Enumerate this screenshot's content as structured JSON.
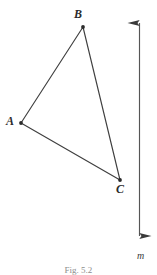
{
  "figure": {
    "background_color": "#ffffff",
    "ink_color": "#3a3a3a",
    "width": 157,
    "height": 275,
    "caption": "Fig. 5.2"
  },
  "labels": {
    "vertex_a": "A",
    "vertex_b": "B",
    "vertex_c": "C",
    "line_m": "m"
  },
  "chart_data": {
    "type": "scatter",
    "title": "",
    "xlabel": "",
    "ylabel": "",
    "xlim": [
      0,
      157
    ],
    "ylim": [
      275,
      0
    ],
    "grid": false,
    "legend": "none",
    "points": [
      {
        "name": "A",
        "x": 21,
        "y": 123,
        "label": "A",
        "label_position": "left"
      },
      {
        "name": "B",
        "x": 83,
        "y": 27,
        "label": "B",
        "label_position": "above"
      },
      {
        "name": "C",
        "x": 120,
        "y": 180,
        "label": "C",
        "label_position": "below-right"
      }
    ],
    "segments": [
      {
        "name": "AB",
        "from": "A",
        "to": "B",
        "x1": 21,
        "y1": 123,
        "x2": 83,
        "y2": 27
      },
      {
        "name": "BC",
        "from": "B",
        "to": "C",
        "x1": 83,
        "y1": 27,
        "x2": 120,
        "y2": 180
      },
      {
        "name": "AC",
        "from": "A",
        "to": "C",
        "x1": 21,
        "y1": 123,
        "x2": 120,
        "y2": 180
      }
    ],
    "lines": [
      {
        "name": "m",
        "label": "m",
        "x1": 139,
        "y1": 11,
        "x2": 139,
        "y2": 248,
        "arrow_start": true,
        "arrow_end": true,
        "orientation": "vertical"
      }
    ],
    "annotations": [
      "Fig. 5.2"
    ]
  }
}
